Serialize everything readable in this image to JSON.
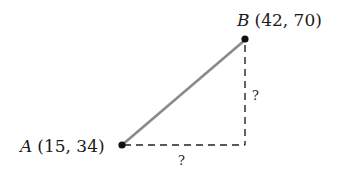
{
  "diagram": {
    "point_a": {
      "name": "A",
      "coords": "(15, 34)",
      "x": 15,
      "y": 34
    },
    "point_b": {
      "name": "B",
      "coords": "(42, 70)",
      "x": 42,
      "y": 70
    },
    "horizontal_leg_label": "?",
    "vertical_leg_label": "?",
    "colors": {
      "segment": "#8a8a8a",
      "dashed": "#222222",
      "point": "#111111"
    }
  }
}
